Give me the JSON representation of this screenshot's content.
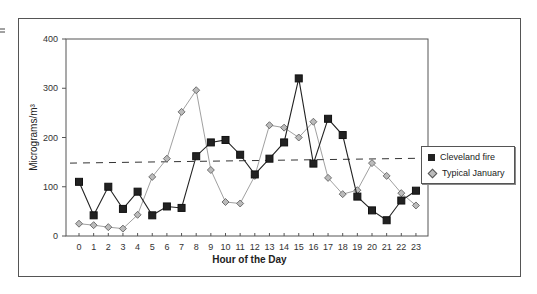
{
  "chart_data": {
    "type": "line",
    "title": "",
    "xlabel": "Hour of the Day",
    "ylabel": "Micrograms/m³",
    "ylim": [
      0,
      400
    ],
    "yticks": [
      0,
      100,
      200,
      300,
      400
    ],
    "x": [
      0,
      1,
      2,
      3,
      4,
      5,
      6,
      7,
      8,
      9,
      10,
      11,
      12,
      13,
      14,
      15,
      16,
      17,
      18,
      19,
      20,
      21,
      22,
      23
    ],
    "series": [
      {
        "name": "Cleveland fire",
        "marker": "square",
        "color": "#222222",
        "values": [
          110,
          42,
          100,
          55,
          90,
          42,
          60,
          57,
          162,
          190,
          195,
          165,
          125,
          157,
          190,
          320,
          147,
          238,
          205,
          80,
          52,
          32,
          72,
          92
        ]
      },
      {
        "name": "Typical January",
        "marker": "diamond",
        "color": "#999999",
        "values": [
          25,
          22,
          18,
          15,
          43,
          120,
          157,
          252,
          296,
          134,
          69,
          66,
          122,
          225,
          220,
          200,
          232,
          118,
          85,
          93,
          148,
          122,
          87,
          62
        ]
      }
    ],
    "reference_line": {
      "style": "dashed",
      "start": 148,
      "end": 158
    },
    "grid": false,
    "legend_position": "right"
  },
  "axis": {
    "y_title": "Micrograms/m³",
    "x_title": "Hour of the Day",
    "y_ticks": [
      "0",
      "100",
      "200",
      "300",
      "400"
    ],
    "x_ticks": [
      "0",
      "1",
      "2",
      "3",
      "4",
      "5",
      "6",
      "7",
      "8",
      "9",
      "10",
      "11",
      "12",
      "13",
      "14",
      "15",
      "16",
      "17",
      "18",
      "19",
      "20",
      "21",
      "22",
      "23"
    ]
  },
  "legend": {
    "items": [
      {
        "label": "Cleveland fire"
      },
      {
        "label": "Typical January"
      }
    ]
  }
}
